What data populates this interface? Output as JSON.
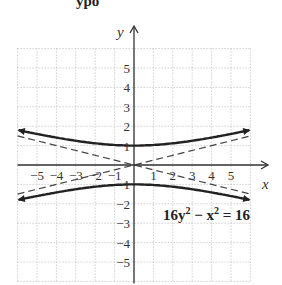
{
  "heading_fragment": "ypo",
  "chart_data": {
    "type": "line",
    "title": "",
    "equation": "16y² − x² = 16",
    "xlabel": "x",
    "ylabel": "y",
    "xlim": [
      -6,
      6
    ],
    "ylim": [
      -6,
      6
    ],
    "grid": true,
    "grid_style": "dotted",
    "x_ticks": [
      -5,
      -4,
      -3,
      -2,
      -1,
      1,
      2,
      3,
      4,
      5
    ],
    "y_ticks": [
      5,
      4,
      3,
      2,
      1,
      -1,
      -2,
      -3,
      -4,
      -5
    ],
    "x_tick_labels": [
      "−5",
      "−4",
      "−3",
      "−2",
      "−1",
      "1",
      "2",
      "3",
      "4",
      "5"
    ],
    "y_tick_labels": [
      "5",
      "4",
      "3",
      "2",
      "1",
      "−1",
      "−2",
      "−3",
      "−4",
      "−5"
    ],
    "series": [
      {
        "name": "upper branch",
        "style": "solid",
        "x": [
          -6,
          -5,
          -4,
          -3,
          -2,
          -1,
          0,
          1,
          2,
          3,
          4,
          5,
          6
        ],
        "y": [
          1.8,
          1.6,
          1.41,
          1.25,
          1.12,
          1.03,
          1.0,
          1.03,
          1.12,
          1.25,
          1.41,
          1.6,
          1.8
        ]
      },
      {
        "name": "lower branch",
        "style": "solid",
        "x": [
          -6,
          -5,
          -4,
          -3,
          -2,
          -1,
          0,
          1,
          2,
          3,
          4,
          5,
          6
        ],
        "y": [
          -1.8,
          -1.6,
          -1.41,
          -1.25,
          -1.12,
          -1.03,
          -1.0,
          -1.03,
          -1.12,
          -1.25,
          -1.41,
          -1.6,
          -1.8
        ]
      },
      {
        "name": "asymptote y = x/4",
        "style": "dashed",
        "x": [
          -6,
          6
        ],
        "y": [
          -1.5,
          1.5
        ]
      },
      {
        "name": "asymptote y = -x/4",
        "style": "dashed",
        "x": [
          -6,
          6
        ],
        "y": [
          1.5,
          -1.5
        ]
      }
    ],
    "vertices": [
      [
        0,
        1
      ],
      [
        0,
        -1
      ]
    ]
  }
}
